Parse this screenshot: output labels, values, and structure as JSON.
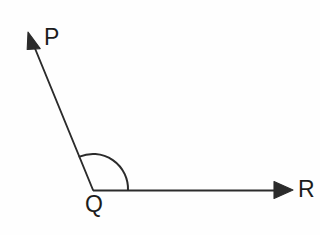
{
  "figure": {
    "background_color": "#fefefe",
    "stroke_color": "#2b2b2b",
    "label_color": "#1c1c1c",
    "width": 320,
    "height": 235
  },
  "labels": {
    "p": "P",
    "q": "Q",
    "r": "R"
  },
  "geometry": {
    "vertex": {
      "name": "Q",
      "x": 93,
      "y": 190
    },
    "rays": [
      {
        "name": "ray-QP",
        "from": {
          "x": 93,
          "y": 190
        },
        "to": {
          "x": 28,
          "y": 32
        },
        "arrowhead": "solid-triangle",
        "endpoint_label": "P"
      },
      {
        "name": "ray-QR",
        "from": {
          "x": 93,
          "y": 190
        },
        "to": {
          "x": 293,
          "y": 190
        },
        "arrowhead": "solid-triangle",
        "endpoint_label": "R"
      }
    ],
    "angle_arc": {
      "name": "angle-PQR-arc",
      "center": {
        "x": 93,
        "y": 190
      },
      "radius": 35,
      "start": {
        "x": 128,
        "y": 190
      },
      "end": {
        "x": 80,
        "y": 157
      },
      "measure_degrees": 113,
      "sweep": "counterclockwise"
    }
  },
  "paths": {
    "ray_qp_line": "M 93 190 L 34 46",
    "ray_qp_arrow": "M 28 32 L 40.2 48.6 L 27.2 49.5 Z",
    "ray_qr_line": "M 93 190.5 L 280 190.5",
    "ray_qr_arrow": "M 293 190 L 274 181.5 L 274 198.5 Z",
    "angle_arc": "M 128 190 A 35 35 0 0 0 79.5 156.7"
  }
}
